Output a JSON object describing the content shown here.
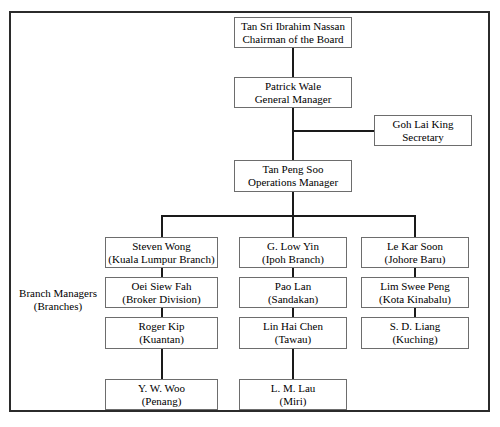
{
  "nodes": {
    "chairman": {
      "name": "Tan Sri Ibrahim Nassan",
      "role": "Chairman of the Board"
    },
    "gm": {
      "name": "Patrick Wale",
      "role": "General Manager"
    },
    "secretary": {
      "name": "Goh Lai King",
      "role": "Secretary"
    },
    "ops": {
      "name": "Tan Peng Soo",
      "role": "Operations Manager"
    },
    "b1r1": {
      "name": "Steven Wong",
      "role": "(Kuala Lumpur Branch)"
    },
    "b1r2": {
      "name": "Oei Siew Fah",
      "role": "(Broker Division)"
    },
    "b1r3": {
      "name": "Roger Kip",
      "role": "(Kuantan)"
    },
    "b1r4": {
      "name": "Y. W. Woo",
      "role": "(Penang)"
    },
    "b2r1": {
      "name": "G. Low Yin",
      "role": "(Ipoh Branch)"
    },
    "b2r2": {
      "name": "Pao Lan",
      "role": "(Sandakan)"
    },
    "b2r3": {
      "name": "Lin Hai Chen",
      "role": "(Tawau)"
    },
    "b2r4": {
      "name": "L. M. Lau",
      "role": "(Miri)"
    },
    "b3r1": {
      "name": "Le Kar Soon",
      "role": "(Johore Baru)"
    },
    "b3r2": {
      "name": "Lim Swee Peng",
      "role": "(Kota Kinabalu)"
    },
    "b3r3": {
      "name": "S. D. Liang",
      "role": "(Kuching)"
    }
  },
  "side_label": {
    "line1": "Branch Managers",
    "line2": "(Branches)"
  },
  "colors": {
    "box_border": "#6d6d6d",
    "frame_border": "#2b2b2b",
    "connector": "#1a1a1a",
    "text": "#000000",
    "background": "#ffffff"
  }
}
